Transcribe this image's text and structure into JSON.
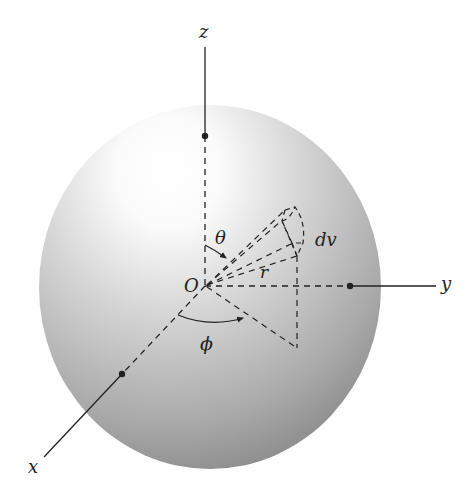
{
  "diagram": {
    "type": "spherical-coordinates",
    "labels": {
      "z_axis": "z",
      "y_axis": "y",
      "x_axis": "x",
      "origin": "O",
      "polar_angle": "θ",
      "azimuth_angle": "ϕ",
      "radius": "r",
      "volume_element": "dv"
    },
    "colors": {
      "line": "#222222",
      "sphere_highlight": "#ffffff",
      "sphere_shadow": "#8c8c8c"
    }
  }
}
